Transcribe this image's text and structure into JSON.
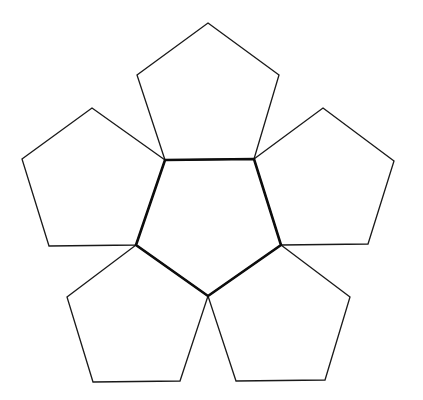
{
  "diagram": {
    "type": "pentagon-net",
    "colors": {
      "background": "#ffffff",
      "outer_stroke": "#1a1a1a",
      "center_stroke": "#0d0d0d"
    },
    "center_pentagon": {
      "name": "center",
      "points": [
        [
          165,
          160
        ],
        [
          254,
          159
        ],
        [
          281,
          245
        ],
        [
          208,
          296
        ],
        [
          136,
          245
        ]
      ]
    },
    "outer_pentagons": [
      {
        "name": "top",
        "points": [
          [
            208,
            23
          ],
          [
            279,
            75
          ],
          [
            254,
            159
          ],
          [
            165,
            160
          ],
          [
            137,
            75
          ]
        ]
      },
      {
        "name": "left",
        "points": [
          [
            92,
            108
          ],
          [
            165,
            160
          ],
          [
            136,
            245
          ],
          [
            49,
            246
          ],
          [
            22,
            159
          ]
        ]
      },
      {
        "name": "right",
        "points": [
          [
            323,
            108
          ],
          [
            394,
            161
          ],
          [
            368,
            244
          ],
          [
            281,
            245
          ],
          [
            254,
            159
          ]
        ]
      },
      {
        "name": "bottom-left",
        "points": [
          [
            136,
            245
          ],
          [
            208,
            296
          ],
          [
            180,
            381
          ],
          [
            93,
            382
          ],
          [
            67,
            297
          ]
        ]
      },
      {
        "name": "bottom-right",
        "points": [
          [
            281,
            245
          ],
          [
            350,
            297
          ],
          [
            325,
            380
          ],
          [
            236,
            381
          ],
          [
            208,
            296
          ]
        ]
      }
    ]
  }
}
